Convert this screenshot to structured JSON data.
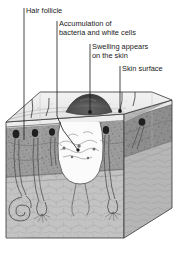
{
  "figure": {
    "background_color": "#ffffff",
    "ink_color": "#1a1a1a",
    "callouts": [
      {
        "id": "hair-follicle",
        "label": "Hair follicle",
        "lines": [
          "Hair follicle"
        ],
        "text_x": 26,
        "text_y": 9,
        "rule_x": 24,
        "rule_y1": 8,
        "rule_y2": 18,
        "leader": "M24,18 L24,140",
        "marker": null
      },
      {
        "id": "accumulation-bacteria-white-cells",
        "label": "Accumulation of bacteria and white cells",
        "lines": [
          "Accumulation of",
          "bacteria and white cells"
        ],
        "text_x": 59,
        "text_y": 22,
        "rule_x": 57,
        "rule_y1": 21,
        "rule_y2": 41,
        "leader": "M57,41 L57,116 L63,130 L78,150",
        "marker": {
          "cx": 78,
          "cy": 150,
          "r": 1.7
        }
      },
      {
        "id": "swelling-appears-on-skin",
        "label": "Swelling appears on the skin",
        "lines": [
          "Swelling appears",
          "on the skin"
        ],
        "text_x": 92,
        "text_y": 45,
        "rule_x": 90,
        "rule_y1": 44,
        "rule_y2": 64,
        "leader": "M90,64 L90,112",
        "marker": {
          "cx": 90,
          "cy": 112,
          "r": 1.9
        }
      },
      {
        "id": "skin-surface",
        "label": "Skin surface",
        "lines": [
          "Skin surface"
        ],
        "text_x": 122,
        "text_y": 67,
        "rule_x": 120,
        "rule_y1": 66,
        "rule_y2": 78,
        "leader": "M120,78 L120,111",
        "marker": {
          "cx": 120,
          "cy": 111,
          "r": 1.9
        }
      }
    ],
    "colors": {
      "epidermis": "#e9e9e9",
      "dermis": "#9d9d9d",
      "dermis_dark": "#8a8a8a",
      "subcutis": "#c0c0c0",
      "abscess_cavity": "#fbfbfb",
      "swelling_dome": "#5d5d5d",
      "side_face": "#b4b4b4",
      "outline": "#3a3a3a"
    }
  }
}
